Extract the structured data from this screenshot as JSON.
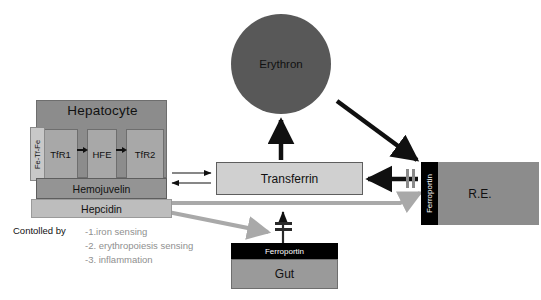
{
  "diagram": {
    "colors": {
      "hepatocyte_fill": "#8c8c8c",
      "receptor_fill": "#a8a8a8",
      "hemojuvelin_fill": "#949494",
      "hepcidin_fill": "#bdbdbd",
      "erythron_fill": "#585858",
      "transferrin_fill": "#d0d0d0",
      "re_fill": "#8c8c8c",
      "gut_fill": "#9a9a9a",
      "ferroportin_fill": "#000000",
      "ferroportin_text": "#ffffff",
      "black_arrow": "#101010",
      "gray_arrow": "#a9a9a9",
      "list_text": "#8f8f8f"
    }
  },
  "hepatocyte": {
    "label": "Hepatocyte",
    "ligand_label": "Fe-Tf-Fe",
    "receptors": [
      {
        "label": "TfR1"
      },
      {
        "label": "HFE"
      },
      {
        "label": "TfR2"
      }
    ],
    "hemojuvelin_label": "Hemojuvelin",
    "hepcidin_label": "Hepcidin"
  },
  "controlled_by": {
    "heading": "Contolled by",
    "items": [
      "-1.iron sensing",
      "-2. erythropoiesis sensing",
      "-3. inflammation"
    ]
  },
  "erythron": {
    "label": "Erythron"
  },
  "transferrin": {
    "label": "Transferrin"
  },
  "reticuloendothelial": {
    "label": "R.E.",
    "ferroportin_label": "Ferroportin"
  },
  "gut": {
    "label": "Gut",
    "ferroportin_label": "Ferroportin"
  }
}
